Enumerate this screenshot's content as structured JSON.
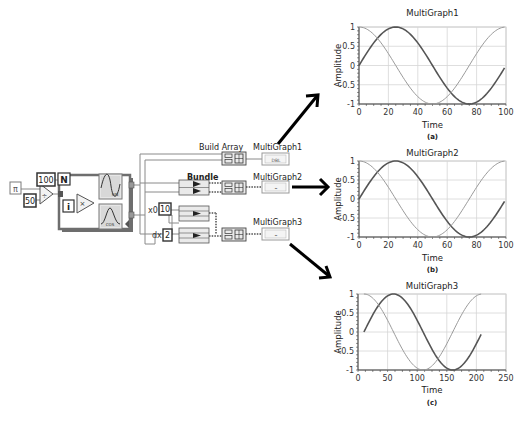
{
  "block_diagram": {
    "constants": {
      "pi": "π",
      "divisor": "50",
      "loop_count": "100",
      "x0_label": "x0",
      "x0_value": "10",
      "dx_label": "dx",
      "dx_value": "2"
    },
    "loop": {
      "count_terminal": "N",
      "iteration_terminal": "i",
      "divide_symbol": "÷",
      "multiply_symbol": "×",
      "sin_label": "SIN",
      "cos_label": "COS"
    },
    "nodes": {
      "build_array": "Build Array",
      "bundle": "Bundle"
    },
    "indicators": [
      {
        "label": "MultiGraph1",
        "terminal": "DBL"
      },
      {
        "label": "MultiGraph2",
        "terminal": "⌁"
      },
      {
        "label": "MultiGraph3",
        "terminal": "⌁"
      }
    ]
  },
  "chart_data": [
    {
      "type": "line",
      "title": "MultiGraph1",
      "caption": "(a)",
      "xlabel": "Time",
      "ylabel": "Amplitude",
      "xlim": [
        0,
        100
      ],
      "ylim": [
        -1,
        1
      ],
      "xticks": [
        0,
        20,
        40,
        60,
        80,
        100
      ],
      "yticks": [
        1,
        0.5,
        0,
        -0.5,
        -1
      ],
      "grid": true,
      "series": [
        {
          "name": "sin",
          "x0": 0,
          "dx": 1,
          "n": 100,
          "func": "sin",
          "period": 100,
          "color": "#555555",
          "width": 1.6
        },
        {
          "name": "cos",
          "x0": 0,
          "dx": 1,
          "n": 100,
          "func": "cos",
          "period": 100,
          "color": "#9a9a9a",
          "width": 1.0
        }
      ]
    },
    {
      "type": "line",
      "title": "MultiGraph2",
      "caption": "(b)",
      "xlabel": "Time",
      "ylabel": "Amplitude",
      "xlim": [
        0,
        100
      ],
      "ylim": [
        -1,
        1
      ],
      "xticks": [
        0,
        20,
        40,
        60,
        80,
        100
      ],
      "yticks": [
        1,
        0.5,
        0,
        -0.5,
        -1
      ],
      "grid": true,
      "series": [
        {
          "name": "sin",
          "x0": 0,
          "dx": 1,
          "n": 100,
          "func": "sin",
          "period": 100,
          "color": "#555555",
          "width": 1.6
        },
        {
          "name": "cos",
          "x0": 0,
          "dx": 1,
          "n": 100,
          "func": "cos",
          "period": 100,
          "color": "#9a9a9a",
          "width": 1.0
        }
      ]
    },
    {
      "type": "line",
      "title": "MultiGraph3",
      "caption": "(c)",
      "xlabel": "Time",
      "ylabel": "Amplitude",
      "xlim": [
        0,
        250
      ],
      "ylim": [
        -1,
        1
      ],
      "xticks": [
        0,
        50,
        100,
        150,
        200,
        250
      ],
      "yticks": [
        1,
        0.5,
        0,
        -0.5,
        -1
      ],
      "grid": true,
      "series": [
        {
          "name": "sin",
          "x0": 10,
          "dx": 2,
          "n": 100,
          "func": "sin",
          "period": 100,
          "color": "#555555",
          "width": 1.6
        },
        {
          "name": "cos",
          "x0": 10,
          "dx": 2,
          "n": 100,
          "func": "cos",
          "period": 100,
          "color": "#9a9a9a",
          "width": 1.0
        }
      ]
    }
  ]
}
